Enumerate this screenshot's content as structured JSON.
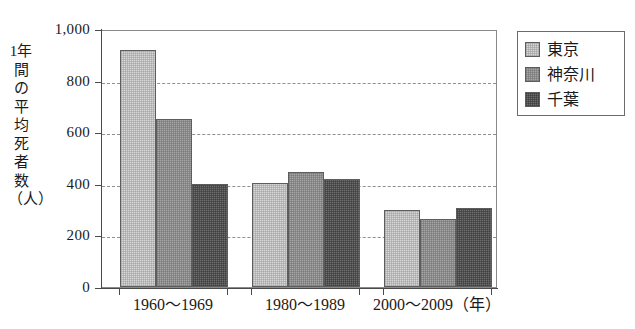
{
  "chart_data": {
    "type": "bar",
    "title": "",
    "xlabel": "(年)",
    "ylabel": "1年間の平均死者数（人）",
    "categories": [
      "1960～1969",
      "1980～1989",
      "2000～2009"
    ],
    "series": [
      {
        "name": "東京",
        "values": [
          920,
          405,
          300
        ]
      },
      {
        "name": "神奈川",
        "values": [
          650,
          445,
          265
        ]
      },
      {
        "name": "千葉",
        "values": [
          400,
          420,
          305
        ]
      }
    ],
    "ylim": [
      0,
      1000
    ],
    "yticks": [
      0,
      200,
      400,
      600,
      800,
      1000
    ],
    "ytick_labels": [
      "0",
      "200",
      "400",
      "600",
      "800",
      "1,000"
    ],
    "grid": true,
    "grid_axis": "y",
    "grid_style": "dashed",
    "legend_position": "right",
    "colors": {
      "series_0": "#d7d7d7",
      "series_1": "#a6a6a6",
      "series_2": "#6e6e6e",
      "axis": "#4a4a4a",
      "grid": "#8f8f8f",
      "background": "#ffffff",
      "text": "#1a1a1a"
    }
  },
  "axis": {
    "y_title": "1年間の平均死者数（人）",
    "x_unit_label": "（年）"
  },
  "legend": {
    "items": [
      {
        "label": "東京"
      },
      {
        "label": "神奈川"
      },
      {
        "label": "千葉"
      }
    ]
  }
}
